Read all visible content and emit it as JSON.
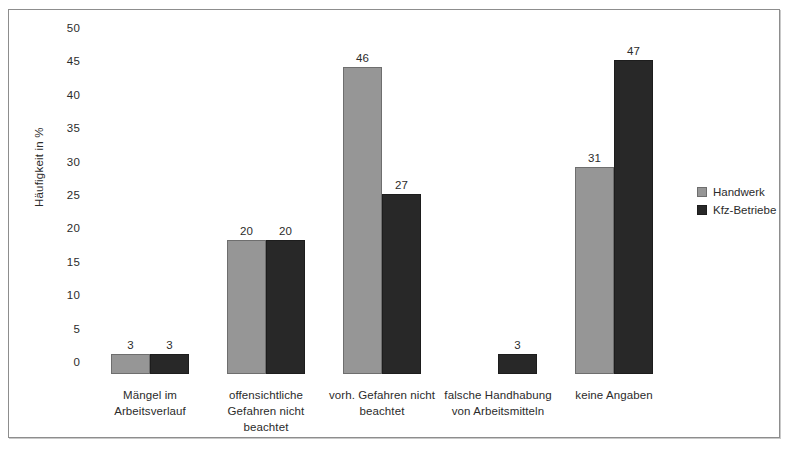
{
  "chart_data": {
    "type": "bar",
    "title": "",
    "xlabel": "",
    "ylabel": "Häufigkeit in %",
    "ylim": [
      0,
      50
    ],
    "ytick_step": 5,
    "yticks": [
      "50",
      "45",
      "40",
      "35",
      "30",
      "25",
      "20",
      "15",
      "10",
      "5",
      "0"
    ],
    "grid": false,
    "legend_position": "right",
    "categories": [
      "Mängel im Arbeitsverlauf",
      "offensichtliche Gefahren nicht beachtet",
      "vorh. Gefahren nicht beachtet",
      "falsche Handhabung von Arbeitsmitteln",
      "keine Angaben"
    ],
    "category_lines": [
      [
        "Mängel im",
        "Arbeitsverlauf"
      ],
      [
        "offensichtliche",
        "Gefahren nicht",
        "beachtet"
      ],
      [
        "vorh. Gefahren nicht",
        "beachtet"
      ],
      [
        "falsche Handhabung",
        "von Arbeitsmitteln"
      ],
      [
        "keine Angaben"
      ]
    ],
    "series": [
      {
        "name": "Handwerk",
        "color": "#969696",
        "values": [
          3,
          20,
          46,
          0,
          31
        ],
        "labels": [
          "3",
          "20",
          "46",
          "",
          "31"
        ]
      },
      {
        "name": "Kfz-Betriebe",
        "color": "#282828",
        "values": [
          3,
          20,
          27,
          3,
          47
        ],
        "labels": [
          "3",
          "20",
          "27",
          "3",
          "47"
        ]
      }
    ]
  },
  "legend": {
    "entries": [
      {
        "label": "Handwerk"
      },
      {
        "label": "Kfz-Betriebe"
      }
    ]
  }
}
